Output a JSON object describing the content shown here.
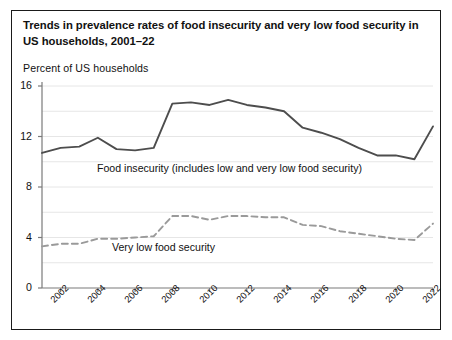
{
  "figure": {
    "title": "Trends in prevalence rates of food insecurity and very low food security in US  households, 2001–22",
    "axis_label": "Percent of US  households",
    "border_color": "#1a1a1a",
    "background": "#ffffff"
  },
  "chart_data": {
    "type": "line",
    "title": "Trends in prevalence rates of food insecurity and very low food security in US  households, 2001–22",
    "xlabel": "",
    "ylabel": "Percent of US  households",
    "ylim": [
      0,
      16
    ],
    "yticks": [
      0,
      4,
      8,
      12,
      16
    ],
    "ytick_labels": [
      "0",
      "4",
      "8",
      "12",
      "16"
    ],
    "grid": true,
    "grid_minor_step": 2,
    "legend": "inline-annotations",
    "x": [
      2001,
      2002,
      2003,
      2004,
      2005,
      2006,
      2007,
      2008,
      2009,
      2010,
      2011,
      2012,
      2013,
      2014,
      2015,
      2016,
      2017,
      2018,
      2019,
      2020,
      2021,
      2022
    ],
    "xtick_labels": [
      "2002",
      "2004",
      "2006",
      "2008",
      "2010",
      "2012",
      "2014",
      "2016",
      "2018",
      "2020",
      "2022"
    ],
    "xticks": [
      2002,
      2004,
      2006,
      2008,
      2010,
      2012,
      2014,
      2016,
      2018,
      2020,
      2022
    ],
    "xlim": [
      2001,
      2022
    ],
    "series": [
      {
        "name": "Food insecurity (includes low and very low food security)",
        "style": "solid",
        "color": "#4d4d4d",
        "label_text": "Food insecurity (includes low and very low food security)",
        "values": [
          10.7,
          11.1,
          11.2,
          11.9,
          11.0,
          10.9,
          11.1,
          14.6,
          14.7,
          14.5,
          14.9,
          14.5,
          14.3,
          14.0,
          12.7,
          12.3,
          11.8,
          11.1,
          10.5,
          10.5,
          10.2,
          12.8
        ]
      },
      {
        "name": "Very low food security",
        "style": "dashed",
        "color": "#9a9a9a",
        "label_text": "Very low food security",
        "values": [
          3.3,
          3.5,
          3.5,
          3.9,
          3.9,
          4.0,
          4.1,
          5.7,
          5.7,
          5.4,
          5.7,
          5.7,
          5.6,
          5.6,
          5.0,
          4.9,
          4.5,
          4.3,
          4.1,
          3.9,
          3.8,
          5.1
        ]
      }
    ]
  }
}
